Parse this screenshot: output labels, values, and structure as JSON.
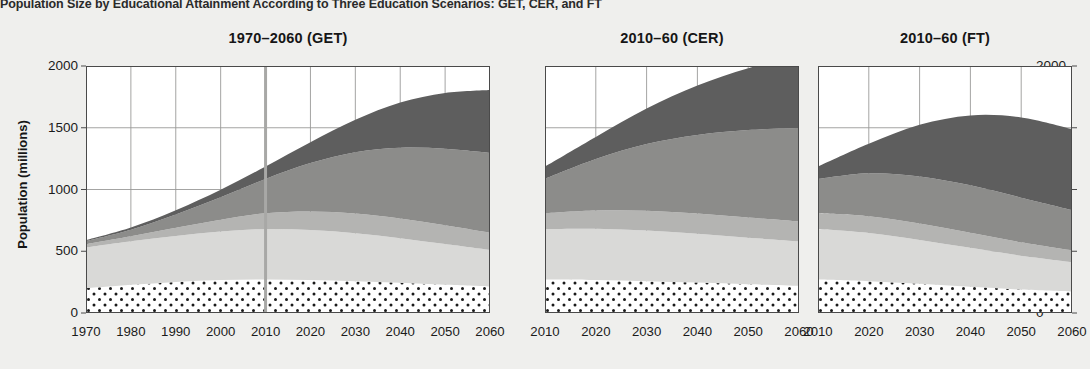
{
  "figure": {
    "title": "Population Size by Educational Attainment According to Three Education Scenarios: GET, CER, and FT",
    "ylabel": "Population (millions)",
    "background_color": "#efefed"
  },
  "axis": {
    "y_ticks": [
      "0",
      "500",
      "1000",
      "1500",
      "2000"
    ],
    "y_tick_values": [
      0,
      500,
      1000,
      1500,
      2000
    ],
    "y_min": 0,
    "y_max": 2000,
    "left_axis_shown": true,
    "right_axis_shown": true
  },
  "colors": {
    "under15": "#ffffff",
    "under15_pattern_dot": "#1a1a1a",
    "no_education": "#d9d9d7",
    "primary": "#b4b4b2",
    "secondary": "#8c8c8a",
    "post_secondary": "#5e5e5e",
    "grid": "#9a9a98",
    "axis": "#4a4a4a",
    "marker_line": "#a8a8a6"
  },
  "panels": [
    {
      "id": "get",
      "title": "1970–2060 (GET)",
      "x_ticks": [
        "1970",
        "1980",
        "1990",
        "2000",
        "2010",
        "2020",
        "2030",
        "2040",
        "2050",
        "2060"
      ],
      "x_min": 1970,
      "x_max": 2060,
      "marker_year": 2010
    },
    {
      "id": "cer",
      "title": "2010–60 (CER)",
      "x_ticks": [
        "2010",
        "2020",
        "2030",
        "2040",
        "2050",
        "2060"
      ],
      "x_min": 2010,
      "x_max": 2060,
      "marker_year": null
    },
    {
      "id": "ft",
      "title": "2010–60 (FT)",
      "x_ticks": [
        "2010",
        "2020",
        "2030",
        "2040",
        "2050",
        "2060"
      ],
      "x_min": 2010,
      "x_max": 2060,
      "marker_year": null
    }
  ],
  "chart_data": {
    "type": "area",
    "title": "Population Size by Educational Attainment According to Three Education Scenarios: GET, CER, and FT",
    "xlabel": "",
    "ylabel": "Population (millions)",
    "ylim": [
      0,
      2000
    ],
    "grid": true,
    "legend_position": "none",
    "stacked": true,
    "series_order_bottom_to_top": [
      "Under 15 / No education (dotted)",
      "Primary",
      "Secondary",
      "Post-secondary",
      "Tertiary"
    ],
    "panels": [
      {
        "name": "1970–2060 (GET)",
        "x": [
          1970,
          1980,
          1990,
          2000,
          2010,
          2020,
          2030,
          2040,
          2050,
          2060
        ],
        "xlim": [
          1970,
          2060
        ],
        "series": [
          {
            "name": "Under 15 / No education (dotted)",
            "values": [
              200,
              228,
              252,
              268,
              272,
              268,
              258,
              244,
              228,
              214
            ]
          },
          {
            "name": "Primary",
            "values": [
              330,
              352,
              372,
              392,
              408,
              404,
              388,
              362,
              330,
              296
            ]
          },
          {
            "name": "Secondary",
            "values": [
              28,
              42,
              66,
              96,
              128,
              150,
              160,
              160,
              152,
              140
            ]
          },
          {
            "name": "Post-secondary",
            "values": [
              24,
              52,
              108,
              182,
              278,
              392,
              496,
              572,
              620,
              646
            ]
          },
          {
            "name": "Tertiary",
            "values": [
              8,
              18,
              34,
              60,
              100,
              168,
              262,
              366,
              452,
              510
            ]
          }
        ],
        "totals": [
          590,
          692,
          832,
          998,
          1186,
          1382,
          1564,
          1704,
          1782,
          1806
        ]
      },
      {
        "name": "2010–60 (CER)",
        "x": [
          2010,
          2020,
          2030,
          2040,
          2050,
          2060
        ],
        "xlim": [
          2010,
          2060
        ],
        "series": [
          {
            "name": "Under 15 / No education (dotted)",
            "values": [
              272,
              268,
              258,
              246,
              232,
              220
            ]
          },
          {
            "name": "Primary",
            "values": [
              408,
              414,
              410,
              396,
              378,
              360
            ]
          },
          {
            "name": "Secondary",
            "values": [
              128,
              148,
              160,
              164,
              164,
              162
            ]
          },
          {
            "name": "Post-secondary",
            "values": [
              278,
              416,
              540,
              636,
              708,
              756
            ]
          },
          {
            "name": "Tertiary",
            "values": [
              100,
              180,
              288,
              400,
              500,
              572
            ]
          }
        ],
        "totals": [
          1186,
          1426,
          1656,
          1842,
          1982,
          2070
        ]
      },
      {
        "name": "2010–60 (FT)",
        "x": [
          2010,
          2020,
          2030,
          2040,
          2050,
          2060
        ],
        "xlim": [
          2010,
          2060
        ],
        "series": [
          {
            "name": "Under 15 / No education (dotted)",
            "values": [
              272,
              258,
              236,
              212,
              190,
              174
            ]
          },
          {
            "name": "Primary",
            "values": [
              408,
              390,
              356,
              316,
              274,
              238
            ]
          },
          {
            "name": "Secondary",
            "values": [
              128,
              136,
              132,
              122,
              108,
              94
            ]
          },
          {
            "name": "Post-secondary",
            "values": [
              278,
              348,
              382,
              384,
              362,
              328
            ]
          },
          {
            "name": "Tertiary",
            "values": [
              100,
              238,
              418,
              566,
              650,
              656
            ]
          }
        ],
        "totals": [
          1186,
          1370,
          1524,
          1600,
          1584,
          1490
        ]
      }
    ]
  }
}
